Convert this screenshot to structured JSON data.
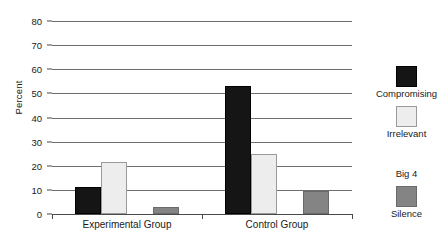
{
  "chart_data": {
    "type": "bar",
    "title": "",
    "xlabel": "",
    "ylabel": "Percent",
    "ylim": [
      0,
      80
    ],
    "yticks": [
      0,
      10,
      20,
      30,
      40,
      50,
      60,
      70,
      80
    ],
    "grid": true,
    "legend_position": "right",
    "categories": [
      "Experimental Group",
      "Control Group"
    ],
    "series": [
      {
        "name": "Compromising",
        "color": "#151515",
        "values": [
          11,
          53
        ]
      },
      {
        "name": "Irrelevant",
        "color": "#ededed",
        "values": [
          21.5,
          25
        ]
      },
      {
        "name": "Big 4",
        "color": "#b2b2b2",
        "values": [
          60,
          8
        ]
      },
      {
        "name": "Silence",
        "color": "#848484",
        "values": [
          3,
          9.5
        ]
      }
    ]
  }
}
